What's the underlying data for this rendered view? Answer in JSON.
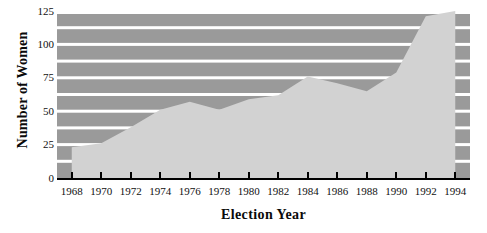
{
  "chart_data": {
    "type": "area",
    "title": "",
    "xlabel": "Election Year",
    "ylabel": "Number of Women",
    "x": [
      1968,
      1970,
      1972,
      1974,
      1976,
      1978,
      1980,
      1982,
      1984,
      1986,
      1988,
      1990,
      1992,
      1994
    ],
    "values": [
      23,
      26,
      38,
      51,
      57,
      51,
      59,
      62,
      76,
      71,
      65,
      79,
      121,
      125
    ],
    "xlim": [
      1967,
      1995
    ],
    "ylim": [
      0,
      125
    ],
    "xticks": [
      1968,
      1970,
      1972,
      1974,
      1976,
      1978,
      1980,
      1982,
      1984,
      1986,
      1988,
      1990,
      1992,
      1994
    ],
    "xticklabels": [
      "1968",
      "1970",
      "1972",
      "1974",
      "1976",
      "1978",
      "1980",
      "1982",
      "1984",
      "1986",
      "1988",
      "1990",
      "1992",
      "1994"
    ],
    "yticks": [
      0,
      25,
      50,
      75,
      100,
      125
    ],
    "yticklabels": [
      "0",
      "25",
      "50",
      "75",
      "100",
      "125"
    ],
    "gridlines": [
      12.5,
      25,
      37.5,
      50,
      62.5,
      75,
      87.5,
      100,
      112.5,
      125
    ],
    "grid": true,
    "legend": null,
    "colors": {
      "plot_background": "#9a9a9a",
      "area_fill": "#d2d2d2",
      "gridline": "#ffffff",
      "axis": "#000000",
      "text": "#101010",
      "page_background": "#ffffff"
    }
  }
}
